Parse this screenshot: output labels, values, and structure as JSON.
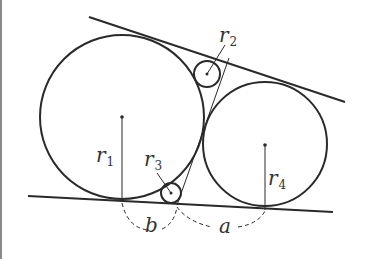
{
  "diagram": {
    "colors": {
      "stroke": "#2a2a2a",
      "background": "#ffffff",
      "border": "#8a8a8a"
    },
    "labels": {
      "r1": {
        "main": "r",
        "sub": "1"
      },
      "r2": {
        "main": "r",
        "sub": "2"
      },
      "r3": {
        "main": "r",
        "sub": "3"
      },
      "r4": {
        "main": "r",
        "sub": "4"
      },
      "a": "a",
      "b": "b"
    },
    "circles": [
      {
        "name": "circle-1",
        "cx": 122,
        "cy": 117,
        "r": 82
      },
      {
        "name": "circle-2",
        "cx": 207,
        "cy": 74,
        "r": 13
      },
      {
        "name": "circle-3",
        "cx": 171,
        "cy": 193,
        "r": 10
      },
      {
        "name": "circle-4",
        "cx": 265,
        "cy": 144,
        "r": 62
      }
    ],
    "lines": [
      {
        "name": "upper-tangent-line",
        "x1": 89,
        "y1": 17,
        "x2": 345,
        "y2": 102
      },
      {
        "name": "lower-tangent-line",
        "x1": 28,
        "y1": 196,
        "x2": 333,
        "y2": 212
      }
    ]
  }
}
